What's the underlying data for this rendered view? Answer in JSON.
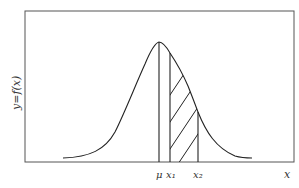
{
  "diagram": {
    "y_axis_label": "y=f(x)",
    "x_axis_label": "x",
    "markers": [
      {
        "label": "μ",
        "position": "mean"
      },
      {
        "label": "x₁",
        "position": "lower bound"
      },
      {
        "label": "x₂",
        "position": "upper bound"
      }
    ],
    "shaded_region": "area under curve from x1 to x2 (hatched)",
    "line_color": "#222222"
  }
}
